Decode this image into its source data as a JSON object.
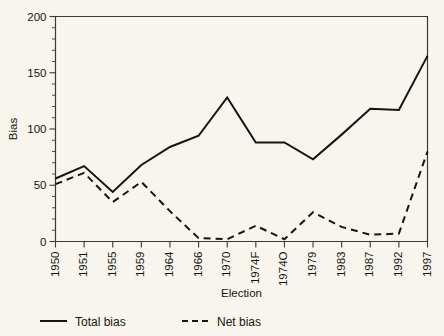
{
  "chart_data": {
    "type": "line",
    "title": "",
    "xlabel": "Election",
    "ylabel": "Bias",
    "ylim": [
      0,
      200
    ],
    "yticks": [
      0,
      50,
      100,
      150,
      200
    ],
    "ytick_labels": [
      "0",
      "50",
      "100",
      "150",
      "200"
    ],
    "grid": false,
    "legend_position": "below-axes",
    "categories": [
      "1950",
      "1951",
      "1955",
      "1959",
      "1964",
      "1966",
      "1970",
      "1974F",
      "1974O",
      "1979",
      "1983",
      "1987",
      "1992",
      "1997"
    ],
    "series": [
      {
        "name": "Total bias",
        "style": "solid",
        "values": [
          56,
          67,
          44,
          68,
          84,
          94,
          128,
          88,
          88,
          73,
          95,
          118,
          117,
          165
        ]
      },
      {
        "name": "Net bias",
        "style": "dashed",
        "values": [
          51,
          61,
          35,
          53,
          27,
          3,
          2,
          14,
          2,
          26,
          13,
          6,
          7,
          80
        ]
      }
    ],
    "legend": [
      {
        "label": "Total bias",
        "style": "solid"
      },
      {
        "label": "Net bias",
        "style": "dashed"
      }
    ]
  },
  "axes": {
    "y_axis_name": "Bias",
    "x_axis_name": "Election"
  },
  "colors": {
    "background": "#f7f5ee",
    "line": "#15150f",
    "axis": "#3a3a36"
  }
}
